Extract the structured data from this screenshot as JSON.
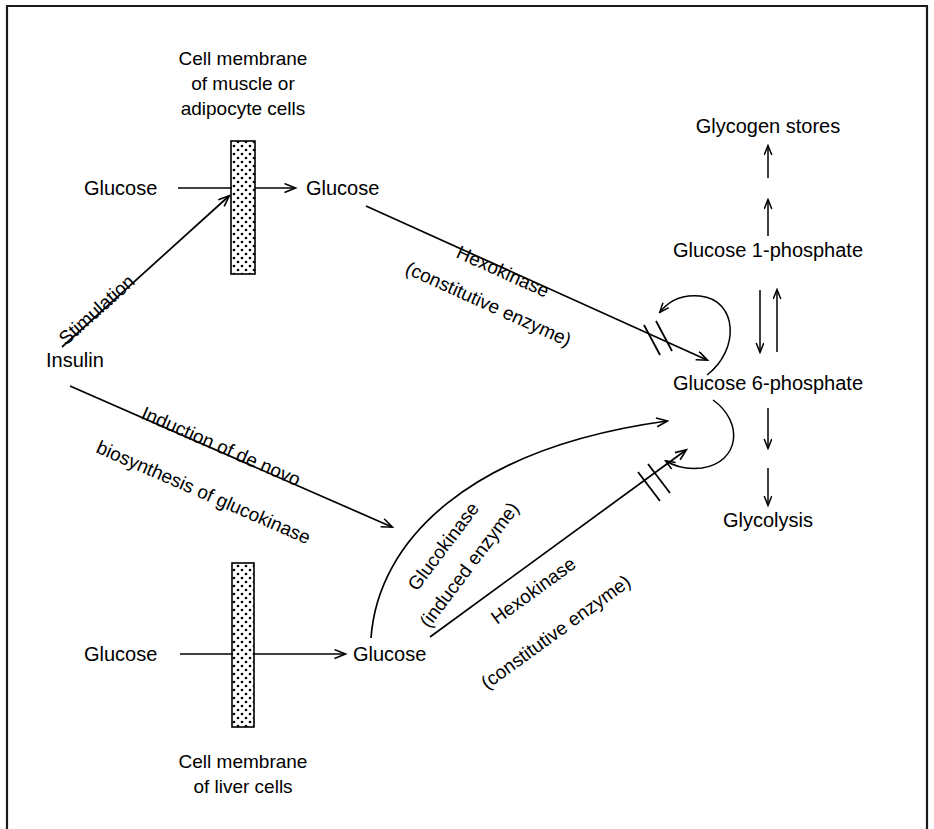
{
  "figure": {
    "background_color": "#ffffff",
    "ink_color": "#000000",
    "frame": {
      "top_border_color": "#1a1a1a",
      "has_top_border": true,
      "has_left_border": true,
      "has_right_border": true,
      "has_bottom_border": false
    }
  },
  "nodes": {
    "glucose_outside_muscle": "Glucose",
    "glucose_inside_muscle": "Glucose",
    "insulin": "Insulin",
    "glucose_outside_liver": "Glucose",
    "glucose_inside_liver": "Glucose",
    "glycogen_stores": "Glycogen stores",
    "glucose_1_phosphate": "Glucose 1-phosphate",
    "glucose_6_phosphate": "Glucose 6-phosphate",
    "glycolysis": "Glycolysis"
  },
  "captions": {
    "muscle_membrane_line1": "Cell membrane",
    "muscle_membrane_line2": "of muscle or",
    "muscle_membrane_line3": "adipocyte cells",
    "liver_membrane_line1": "Cell membrane",
    "liver_membrane_line2": "of liver cells"
  },
  "edge_labels": {
    "stimulation": "Stimulation",
    "induction_line1": "Induction of de novo",
    "induction_line2": "biosynthesis of glucokinase",
    "hexokinase_muscle_line1": "Hexokinase",
    "hexokinase_muscle_line2": "(constitutive enzyme)",
    "glucokinase_line1": "Glucokinase",
    "glucokinase_line2": "(induced enzyme)",
    "hexokinase_liver_line1": "Hexokinase",
    "hexokinase_liver_line2": "(constitutive enzyme)"
  },
  "annotations": {
    "inhibition_marker": "double slash (feedback inhibition)",
    "reversible_marker": "paired opposing arrows (reversible reaction)"
  }
}
